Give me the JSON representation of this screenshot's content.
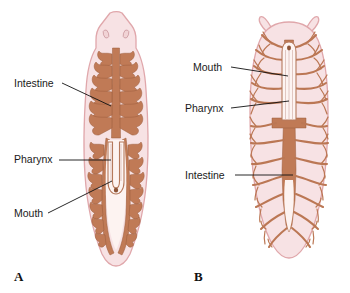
{
  "figure": {
    "background_color": "#ffffff",
    "body_fill_color": "#f7e2e4",
    "body_outline_color": "#e0a7ab",
    "gut_color": "#c07a56",
    "label_color": "#1a1a1a"
  },
  "panels": [
    {
      "letter": "A",
      "organism": "three-branched planarian",
      "head_shape": "triangular with two eyespots",
      "labels": [
        {
          "text": "Intestine",
          "target": "branched-intestine"
        },
        {
          "text": "Pharynx",
          "target": "pharynx-tube"
        },
        {
          "text": "Mouth",
          "target": "mouth-opening"
        }
      ]
    },
    {
      "letter": "B",
      "organism": "many-branched planarian",
      "head_shape": "rounded with two tentacles",
      "labels": [
        {
          "text": "Mouth",
          "target": "mouth-opening"
        },
        {
          "text": "Pharynx",
          "target": "pharynx-tube"
        },
        {
          "text": "Intestine",
          "target": "branched-intestine"
        }
      ]
    }
  ],
  "anatomy_parts": {
    "intestine": "Intestine",
    "pharynx": "Pharynx",
    "mouth": "Mouth",
    "eyespot": "eyespot",
    "tentacle": "tentacle"
  }
}
